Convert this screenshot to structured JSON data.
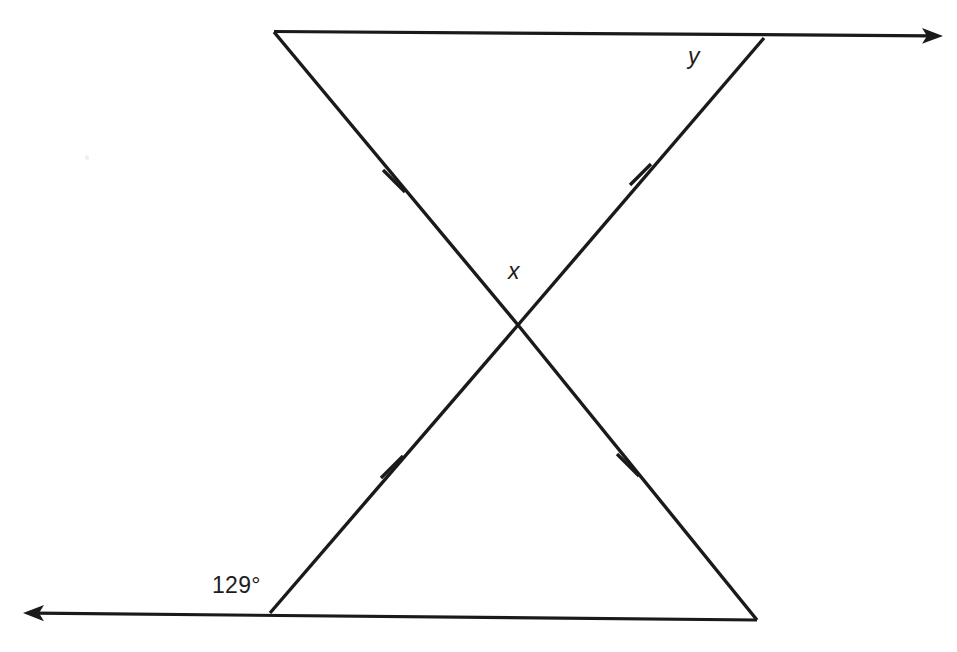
{
  "figure": {
    "kind": "geometry-diagram",
    "background_color": "#ffffff",
    "stroke_color": "#1a1a1a"
  },
  "labels": {
    "known_angle": "129°",
    "unknown_angle_center": "x",
    "unknown_angle_top": "y"
  },
  "points": {
    "top_left_vertex": {
      "x": 274,
      "y": 32
    },
    "top_right_vertex": {
      "x": 764,
      "y": 38
    },
    "bottom_left_vertex": {
      "x": 270,
      "y": 613
    },
    "bottom_right_vertex": {
      "x": 757,
      "y": 620
    },
    "intersection": {
      "x": 518,
      "y": 325
    },
    "top_ray_arrow_tip": {
      "x": 943,
      "y": 36
    },
    "bottom_ray_arrow_tip": {
      "x": 23,
      "y": 613
    }
  },
  "segments": [
    {
      "name": "top-ray",
      "from": "top_left_vertex",
      "to": "top_ray_arrow_tip",
      "arrow": "right"
    },
    {
      "name": "bottom-ray",
      "from": "bottom_right_vertex",
      "to": "bottom_ray_arrow_tip",
      "arrow": "left"
    },
    {
      "name": "transversal-upper-left-to-center",
      "from": "top_left_vertex",
      "to": "intersection",
      "tick": true
    },
    {
      "name": "transversal-upper-right-to-center",
      "from": "top_right_vertex",
      "to": "intersection",
      "tick": true
    },
    {
      "name": "transversal-lower-left-to-center",
      "from": "bottom_left_vertex",
      "to": "intersection",
      "tick": true
    },
    {
      "name": "transversal-lower-right-to-center",
      "from": "bottom_right_vertex",
      "to": "intersection",
      "tick": true
    }
  ],
  "tick_marks": [
    {
      "name": "tick-upper-left",
      "x": 394,
      "y": 181
    },
    {
      "name": "tick-upper-right",
      "x": 641,
      "y": 174
    },
    {
      "name": "tick-lower-left",
      "x": 392,
      "y": 467
    },
    {
      "name": "tick-lower-right",
      "x": 628,
      "y": 465
    }
  ],
  "label_positions": {
    "known_angle": {
      "x": 242,
      "y": 586
    },
    "unknown_angle_center": {
      "x": 518,
      "y": 272
    },
    "unknown_angle_top": {
      "x": 697,
      "y": 58
    }
  }
}
